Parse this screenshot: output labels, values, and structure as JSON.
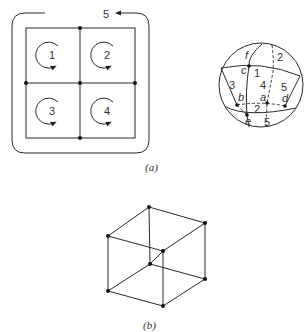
{
  "figure_a": {
    "caption": "(a)",
    "grid": {
      "faces": [
        {
          "label": "1",
          "cx": 52,
          "cy": 55
        },
        {
          "label": "2",
          "cx": 107,
          "cy": 55
        },
        {
          "label": "3",
          "cx": 52,
          "cy": 111
        },
        {
          "label": "4",
          "cx": 107,
          "cy": 111
        }
      ],
      "outer_face_label": "5"
    },
    "sphere": {
      "face_labels": [
        "1",
        "2",
        "3",
        "4",
        "5",
        "5"
      ],
      "vertex_labels": {
        "a": "a",
        "b": "b",
        "c": "c",
        "d": "d",
        "e": "e"
      },
      "extra_labels": {
        "f": "f",
        "z": "2"
      }
    }
  },
  "figure_b": {
    "caption": "(b)"
  }
}
